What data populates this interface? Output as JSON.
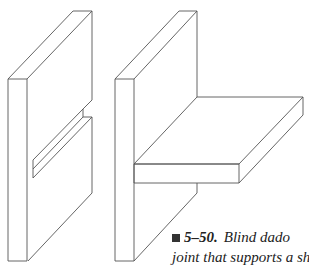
{
  "figure": {
    "number": "5–50.",
    "caption_line1": "Blind dado",
    "caption_line2": "joint that supports a shelf.",
    "stroke_color": "#555555",
    "marker_color": "#333333"
  }
}
